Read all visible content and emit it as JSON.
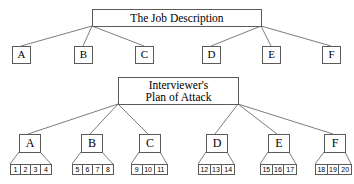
{
  "diagram": {
    "title_top": "The Job Description",
    "title_bottom_line1": "Interviewer's",
    "title_bottom_line2": "Plan of Attack",
    "colors": {
      "background": "#ffffff",
      "line": "#5a5a5a",
      "text": "#000000"
    },
    "top_level_nodes": [
      {
        "label": "A"
      },
      {
        "label": "B"
      },
      {
        "label": "C"
      },
      {
        "label": "D"
      },
      {
        "label": "E"
      },
      {
        "label": "F"
      }
    ],
    "bottom_level_nodes": [
      {
        "label": "A",
        "items": [
          "1",
          "2",
          "3",
          "4"
        ]
      },
      {
        "label": "B",
        "items": [
          "5",
          "6",
          "7",
          "8"
        ]
      },
      {
        "label": "C",
        "items": [
          "9",
          "10",
          "11"
        ]
      },
      {
        "label": "D",
        "items": [
          "12",
          "13",
          "14"
        ]
      },
      {
        "label": "E",
        "items": [
          "15",
          "16",
          "17"
        ]
      },
      {
        "label": "F",
        "items": [
          "18",
          "19",
          "20"
        ]
      }
    ]
  }
}
